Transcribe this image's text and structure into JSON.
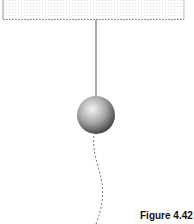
{
  "diagram": {
    "support": {
      "type": "ceiling-block"
    },
    "string": {
      "type": "taut-line"
    },
    "bob": {
      "type": "sphere"
    },
    "trajectory": {
      "type": "dashed-curve"
    }
  },
  "caption": {
    "label": "Figure 4.42",
    "text": "C"
  },
  "colors": {
    "line": "#444444",
    "box_border": "#888888",
    "bob_light": "#f0f0f0",
    "bob_dark": "#555555"
  }
}
